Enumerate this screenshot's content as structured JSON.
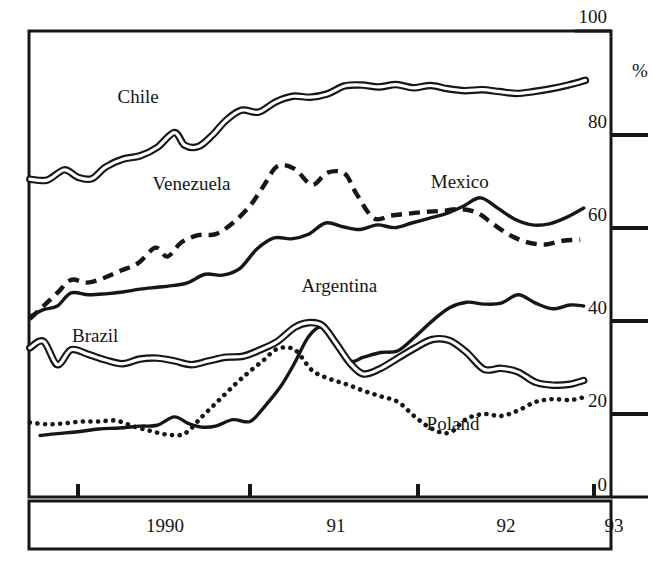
{
  "chart_data": {
    "type": "line",
    "title": "",
    "subtitle": "",
    "xlabel": "",
    "ylabel": "%",
    "xlim": [
      1989.6,
      1993.0
    ],
    "ylim": [
      0,
      100
    ],
    "grid": false,
    "legend_position": "inline-labels",
    "x_tick_labels": [
      "1990",
      "91",
      "92",
      "93"
    ],
    "x_tick_values": [
      1990,
      1991,
      1992,
      1993
    ],
    "y_tick_labels": [
      "0",
      "20",
      "40",
      "60",
      "80",
      "100"
    ],
    "y_tick_values": [
      0,
      20,
      40,
      60,
      80,
      100
    ],
    "y_unit_label": "%",
    "series": [
      {
        "name": "Chile",
        "style": "double-line",
        "label_x": 1990.35,
        "label_y": 84.5,
        "x": [
          1989.72,
          1989.82,
          1989.92,
          1990.0,
          1990.08,
          1990.16,
          1990.26,
          1990.36,
          1990.46,
          1990.56,
          1990.62,
          1990.7,
          1990.78,
          1990.86,
          1990.95,
          1991.05,
          1991.15,
          1991.25,
          1991.35,
          1991.45,
          1991.55,
          1991.65,
          1991.75,
          1991.85,
          1991.95,
          1992.05,
          1992.15,
          1992.25,
          1992.35,
          1992.45,
          1992.55,
          1992.65,
          1992.75,
          1992.85,
          1992.95
        ],
        "y": [
          68.2,
          68.0,
          70.2,
          68.6,
          68.3,
          70.8,
          72.5,
          73.2,
          75.0,
          78.2,
          75.5,
          75.2,
          77.6,
          80.8,
          83.0,
          82.6,
          84.8,
          86.0,
          85.8,
          86.5,
          88.2,
          88.4,
          88.0,
          88.5,
          87.8,
          88.3,
          87.6,
          87.2,
          87.4,
          87.0,
          86.6,
          87.0,
          87.6,
          88.4,
          89.4
        ]
      },
      {
        "name": "Venezuela",
        "style": "dashed",
        "label_x": 1990.66,
        "label_y": 65.8,
        "x": [
          1989.72,
          1989.8,
          1989.88,
          1989.96,
          1990.05,
          1990.15,
          1990.25,
          1990.35,
          1990.45,
          1990.52,
          1990.6,
          1990.7,
          1990.8,
          1990.9,
          1991.0,
          1991.08,
          1991.16,
          1991.26,
          1991.36,
          1991.45,
          1991.55,
          1991.62,
          1991.72,
          1991.82,
          1991.92,
          1992.02,
          1992.12,
          1992.22,
          1992.32,
          1992.42,
          1992.52,
          1992.62,
          1992.72,
          1992.82,
          1992.92
        ],
        "y": [
          38.2,
          41.0,
          43.8,
          46.6,
          46.0,
          47.0,
          48.6,
          50.2,
          53.5,
          51.6,
          54.6,
          56.2,
          56.4,
          58.8,
          62.5,
          66.8,
          71.0,
          70.4,
          67.0,
          69.6,
          69.4,
          65.0,
          59.8,
          60.4,
          60.8,
          61.2,
          61.4,
          61.8,
          61.0,
          58.4,
          56.0,
          54.6,
          54.2,
          55.0,
          55.2
        ]
      },
      {
        "name": "Mexico",
        "style": "solid",
        "label_x": 1992.22,
        "label_y": 66.4,
        "x": [
          1989.72,
          1989.8,
          1989.88,
          1989.96,
          1990.06,
          1990.16,
          1990.26,
          1990.36,
          1990.46,
          1990.56,
          1990.64,
          1990.74,
          1990.84,
          1990.94,
          1991.04,
          1991.14,
          1991.24,
          1991.34,
          1991.44,
          1991.54,
          1991.64,
          1991.74,
          1991.84,
          1991.94,
          1992.04,
          1992.14,
          1992.24,
          1992.34,
          1992.44,
          1992.54,
          1992.64,
          1992.74,
          1992.84,
          1992.94
        ],
        "y": [
          38.8,
          40.2,
          41.0,
          43.8,
          43.4,
          43.6,
          44.0,
          44.6,
          45.0,
          45.4,
          46.0,
          47.8,
          47.6,
          49.0,
          53.2,
          55.6,
          55.4,
          56.4,
          58.8,
          58.0,
          57.4,
          58.4,
          57.8,
          58.8,
          59.8,
          60.8,
          62.4,
          64.2,
          62.0,
          59.6,
          58.4,
          58.6,
          60.0,
          62.0
        ]
      },
      {
        "name": "Argentina",
        "style": "solid",
        "label_x": 1991.52,
        "label_y": 44.0,
        "x": [
          1989.78,
          1989.88,
          1990.0,
          1990.12,
          1990.24,
          1990.36,
          1990.46,
          1990.56,
          1990.64,
          1990.72,
          1990.8,
          1990.9,
          1991.0,
          1991.08,
          1991.18,
          1991.26,
          1991.34,
          1991.42,
          1991.5,
          1991.58,
          1991.66,
          1991.76,
          1991.86,
          1991.96,
          1992.06,
          1992.16,
          1992.26,
          1992.36,
          1992.46,
          1992.56,
          1992.66,
          1992.76,
          1992.86,
          1992.94
        ],
        "y": [
          13.2,
          13.6,
          14.0,
          14.6,
          14.8,
          15.2,
          15.4,
          17.2,
          15.8,
          15.0,
          15.2,
          16.6,
          16.2,
          19.2,
          23.8,
          28.8,
          34.4,
          36.5,
          33.0,
          29.2,
          30.0,
          31.0,
          31.4,
          34.4,
          37.8,
          40.6,
          41.8,
          41.4,
          41.6,
          43.4,
          41.6,
          40.4,
          41.2,
          41.0
        ]
      },
      {
        "name": "Brazil",
        "style": "double-line",
        "label_x": 1990.1,
        "label_y": 33.2,
        "x": [
          1989.72,
          1989.8,
          1989.88,
          1989.96,
          1990.06,
          1990.16,
          1990.26,
          1990.36,
          1990.46,
          1990.56,
          1990.66,
          1990.76,
          1990.86,
          1990.96,
          1991.06,
          1991.16,
          1991.26,
          1991.34,
          1991.42,
          1991.5,
          1991.58,
          1991.66,
          1991.76,
          1991.86,
          1991.96,
          1992.06,
          1992.16,
          1992.26,
          1992.36,
          1992.46,
          1992.56,
          1992.66,
          1992.76,
          1992.86,
          1992.94
        ],
        "y": [
          32.0,
          33.4,
          28.4,
          31.6,
          30.6,
          29.4,
          28.6,
          29.6,
          29.8,
          29.2,
          28.4,
          29.2,
          30.0,
          30.2,
          31.6,
          33.4,
          36.4,
          37.4,
          36.8,
          33.0,
          28.8,
          26.4,
          27.6,
          29.8,
          32.0,
          33.8,
          33.6,
          31.0,
          27.4,
          27.6,
          26.8,
          24.6,
          24.0,
          24.2,
          25.0
        ]
      },
      {
        "name": "Poland",
        "style": "dotted",
        "label_x": 1992.18,
        "label_y": 14.4,
        "x": [
          1989.72,
          1989.82,
          1989.92,
          1990.02,
          1990.12,
          1990.22,
          1990.32,
          1990.42,
          1990.52,
          1990.62,
          1990.72,
          1990.82,
          1990.92,
          1991.0,
          1991.08,
          1991.16,
          1991.26,
          1991.36,
          1991.46,
          1991.56,
          1991.66,
          1991.76,
          1991.86,
          1991.96,
          1992.06,
          1992.16,
          1992.26,
          1992.36,
          1992.46,
          1992.56,
          1992.66,
          1992.76,
          1992.86,
          1992.94
        ],
        "y": [
          16.0,
          15.6,
          15.8,
          16.2,
          16.2,
          16.4,
          15.2,
          14.2,
          13.4,
          13.6,
          17.2,
          20.8,
          24.4,
          27.0,
          29.4,
          31.8,
          31.6,
          27.2,
          25.4,
          24.2,
          22.8,
          21.6,
          20.4,
          17.2,
          14.6,
          13.8,
          16.8,
          17.8,
          17.4,
          18.6,
          20.4,
          21.0,
          20.8,
          21.4
        ]
      }
    ]
  },
  "axis": {
    "y_top_label": "100",
    "y_percent_label": "%",
    "y_80": "80",
    "y_60": "60",
    "y_40": "40",
    "y_20": "20",
    "y_0": "0",
    "x_1990": "1990",
    "x_91": "91",
    "x_92": "92",
    "x_93": "93"
  },
  "series_labels": {
    "chile": "Chile",
    "venezuela": "Venezuela",
    "mexico": "Mexico",
    "argentina": "Argentina",
    "brazil": "Brazil",
    "poland": "Poland"
  },
  "colors": {
    "ink": "#161616",
    "background": "#ffffff"
  }
}
